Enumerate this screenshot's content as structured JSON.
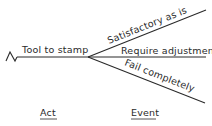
{
  "diagram": {
    "type": "decision-tree",
    "act": {
      "label": "Tool to stamp"
    },
    "events": [
      {
        "label": "Satisfactory as is"
      },
      {
        "label": "Require adjustment"
      },
      {
        "label": "Fail completely"
      }
    ],
    "column_labels": {
      "act": "Act",
      "event": "Event"
    },
    "line_color": "#2a2a2a"
  }
}
